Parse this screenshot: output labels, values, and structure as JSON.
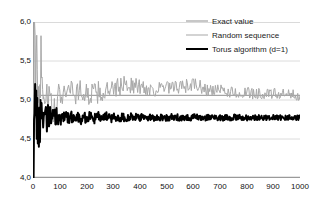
{
  "chart_data": {
    "type": "line",
    "title": "",
    "subtitle": "",
    "xlabel": "",
    "ylabel": "",
    "xlim": [
      0,
      1000
    ],
    "ylim": [
      4.0,
      6.0
    ],
    "grid": true,
    "grid_axis": "y",
    "legend_position": "upper-right-inside",
    "x_ticks": [
      0,
      100,
      200,
      300,
      400,
      500,
      600,
      700,
      800,
      900,
      1000
    ],
    "x_tick_labels": [
      "0",
      "100",
      "200",
      "300",
      "400",
      "500",
      "600",
      "700",
      "800",
      "900",
      "1000"
    ],
    "y_ticks": [
      4.0,
      4.5,
      5.0,
      5.5,
      6.0
    ],
    "y_tick_labels": [
      "4,0",
      "4,5",
      "5,0",
      "5,5",
      "6,0"
    ],
    "decimal_separator": ",",
    "series": [
      {
        "name": "Exact value",
        "type": "horizontal-line",
        "color": "#8f8f8f",
        "width": 1,
        "value": 5.06,
        "x": [
          0,
          1000
        ],
        "values": [
          5.06,
          5.06
        ]
      },
      {
        "name": "Random sequence",
        "type": "line",
        "color": "#a8a8a8",
        "width": 1,
        "x": [
          2,
          4,
          6,
          8,
          10,
          12,
          14,
          16,
          18,
          20,
          22,
          24,
          26,
          28,
          30,
          32,
          34,
          36,
          38,
          40,
          44,
          48,
          52,
          56,
          60,
          64,
          68,
          72,
          76,
          80,
          84,
          88,
          92,
          96,
          100,
          110,
          120,
          130,
          140,
          150,
          160,
          170,
          180,
          190,
          200,
          215,
          230,
          245,
          260,
          275,
          290,
          305,
          320,
          335,
          350,
          365,
          380,
          395,
          410,
          425,
          440,
          455,
          470,
          485,
          500,
          515,
          530,
          545,
          560,
          575,
          590,
          605,
          620,
          635,
          650,
          665,
          680,
          695,
          710,
          725,
          740,
          755,
          770,
          785,
          800,
          820,
          840,
          860,
          880,
          900,
          920,
          940,
          960,
          980,
          1000
        ],
        "values": [
          4.02,
          5.64,
          5.18,
          5.32,
          5.02,
          5.24,
          5.44,
          5.21,
          5.36,
          5.18,
          5.29,
          5.41,
          5.22,
          5.33,
          5.46,
          5.26,
          5.54,
          5.3,
          5.19,
          5.25,
          5.13,
          5.06,
          5.11,
          4.98,
          5.03,
          4.92,
          4.85,
          4.8,
          4.77,
          4.79,
          4.84,
          4.88,
          4.95,
          5.0,
          5.06,
          5.12,
          5.16,
          5.13,
          5.18,
          5.12,
          5.08,
          5.14,
          5.09,
          5.11,
          5.06,
          5.09,
          5.07,
          5.1,
          5.08,
          5.12,
          5.09,
          5.14,
          5.16,
          5.19,
          5.21,
          5.2,
          5.17,
          5.18,
          5.16,
          5.14,
          5.15,
          5.13,
          5.15,
          5.14,
          5.16,
          5.14,
          5.15,
          5.17,
          5.16,
          5.18,
          5.19,
          5.2,
          5.18,
          5.15,
          5.13,
          5.12,
          5.13,
          5.11,
          5.12,
          5.1,
          5.11,
          5.09,
          5.1,
          5.08,
          5.09,
          5.08,
          5.09,
          5.08,
          5.07,
          5.08,
          5.07,
          5.07,
          5.06,
          5.07,
          5.06
        ]
      },
      {
        "name": "Torus algorithm (d=1)",
        "type": "line",
        "color": "#000000",
        "width": 2,
        "x": [
          2,
          4,
          6,
          8,
          10,
          12,
          14,
          16,
          18,
          20,
          22,
          24,
          26,
          28,
          30,
          32,
          34,
          36,
          38,
          40,
          44,
          48,
          52,
          56,
          60,
          64,
          68,
          72,
          76,
          80,
          84,
          88,
          92,
          96,
          100,
          110,
          120,
          130,
          140,
          150,
          160,
          170,
          180,
          190,
          200,
          215,
          230,
          245,
          260,
          275,
          290,
          305,
          320,
          335,
          350,
          365,
          380,
          395,
          410,
          425,
          440,
          455,
          470,
          485,
          500,
          515,
          530,
          545,
          560,
          575,
          590,
          605,
          620,
          635,
          650,
          665,
          680,
          695,
          710,
          725,
          740,
          755,
          770,
          785,
          800,
          820,
          840,
          860,
          880,
          900,
          920,
          940,
          960,
          980,
          1000
        ],
        "values": [
          4.02,
          4.95,
          4.48,
          4.9,
          4.52,
          4.86,
          4.56,
          4.88,
          4.58,
          4.92,
          4.6,
          4.87,
          4.62,
          4.86,
          4.64,
          4.85,
          4.66,
          4.84,
          4.68,
          4.86,
          4.7,
          4.84,
          4.71,
          4.83,
          4.72,
          4.82,
          4.73,
          4.81,
          4.735,
          4.815,
          4.74,
          4.81,
          4.745,
          4.805,
          4.75,
          4.8,
          4.752,
          4.798,
          4.754,
          4.796,
          4.756,
          4.794,
          4.758,
          4.792,
          4.76,
          4.79,
          4.762,
          4.788,
          4.763,
          4.787,
          4.764,
          4.786,
          4.765,
          4.785,
          4.766,
          4.784,
          4.767,
          4.783,
          4.768,
          4.782,
          4.768,
          4.781,
          4.769,
          4.781,
          4.769,
          4.78,
          4.77,
          4.78,
          4.77,
          4.779,
          4.771,
          4.779,
          4.771,
          4.778,
          4.772,
          4.778,
          4.772,
          4.777,
          4.772,
          4.777,
          4.773,
          4.777,
          4.773,
          4.776,
          4.773,
          4.776,
          4.774,
          4.776,
          4.774,
          4.775,
          4.774,
          4.775,
          4.774,
          4.775,
          4.774
        ]
      }
    ]
  },
  "legend": {
    "items": [
      {
        "label": "Exact value",
        "color": "#8f8f8f",
        "style": "thin-gray"
      },
      {
        "label": "Random sequence",
        "color": "#a8a8a8",
        "style": "thin-gray"
      },
      {
        "label": "Torus algorithm (d=1)",
        "color": "#000000",
        "style": "thick-black"
      }
    ]
  },
  "axes": {
    "y_labels": [
      "6,0",
      "5,5",
      "5,0",
      "4,5",
      "4,0"
    ],
    "x_labels": [
      "0",
      "100",
      "200",
      "300",
      "400",
      "500",
      "600",
      "700",
      "800",
      "900",
      "1000"
    ]
  },
  "colors": {
    "background": "#ffffff",
    "axis": "#9a9a9a",
    "grid": "#d9d9d9",
    "exact": "#8f8f8f",
    "random": "#a8a8a8",
    "torus": "#000000"
  }
}
